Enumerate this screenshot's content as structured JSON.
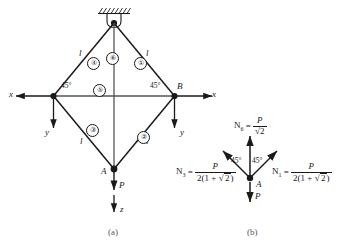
{
  "figure": {
    "title_parts": {
      "caption_a": "(a)",
      "caption_b": "(b)"
    },
    "panel_a": {
      "support": {
        "name": "pin-support-hatched",
        "label": ""
      },
      "nodes": [
        {
          "id": "top",
          "label": ""
        },
        {
          "id": "left",
          "label": ""
        },
        {
          "id": "right",
          "label": "B"
        },
        {
          "id": "bottom",
          "label": "A"
        }
      ],
      "members": [
        {
          "id": 1,
          "circled": "①",
          "length_label": "l"
        },
        {
          "id": 2,
          "circled": "②",
          "length_label": "l"
        },
        {
          "id": 3,
          "circled": "③",
          "length_label": "l"
        },
        {
          "id": 4,
          "circled": "④",
          "length_label": "l"
        },
        {
          "id": 5,
          "circled": "⑤",
          "length_label": ""
        },
        {
          "id": 6,
          "circled": "⑥",
          "length_label": ""
        }
      ],
      "angles": [
        {
          "at": "left-node",
          "value": "45°"
        },
        {
          "at": "right-node",
          "value": "45°"
        }
      ],
      "axes": [
        {
          "name": "x-axis-left",
          "label": "x"
        },
        {
          "name": "x-axis-right",
          "label": "x"
        },
        {
          "name": "y-axis-left",
          "label": "y"
        },
        {
          "name": "y-axis-right",
          "label": "y"
        },
        {
          "name": "z-axis-bottom",
          "label": "z"
        }
      ],
      "loads": [
        {
          "name": "load-P-at-A",
          "label": "P"
        }
      ]
    },
    "panel_b": {
      "node_label": "A",
      "load_label": "P",
      "angles": [
        {
          "at": "left-of-vertical",
          "value": "45°"
        },
        {
          "at": "right-of-vertical",
          "value": "45°"
        }
      ],
      "equations": [
        {
          "name": "N6-equation",
          "lhs": "N",
          "sub": "6",
          "eq": "=",
          "numerator": "P",
          "denominator_prefix": "",
          "denominator": "√2",
          "denominator_plain": "2"
        },
        {
          "name": "N3-equation",
          "lhs": "N",
          "sub": "3",
          "eq": "=",
          "numerator": "P",
          "denominator_prefix": "2(1 + ",
          "denominator": "2",
          "denominator_suffix": ")"
        },
        {
          "name": "N1-equation",
          "lhs": "N",
          "sub": "1",
          "eq": "=",
          "numerator": "P",
          "denominator_prefix": "2(1 + ",
          "denominator": "2",
          "denominator_suffix": ")"
        }
      ]
    },
    "colors": {
      "ink": "#1a1a1a",
      "caption": "#555555",
      "background": "#ffffff"
    }
  }
}
